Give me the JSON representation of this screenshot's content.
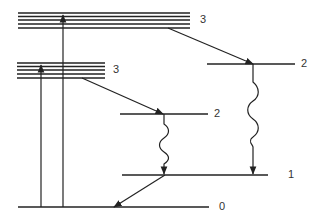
{
  "diagram": {
    "type": "energy-level-diagram",
    "colors": {
      "line": "#222222",
      "label": "#333333"
    },
    "level_labels": {
      "upper_band": "3",
      "lower_band": "3",
      "right_level_2": "2",
      "middle_level_2": "2",
      "level_1": "1",
      "level_0": "0"
    },
    "bands": [
      {
        "id": "upper_band",
        "label": "3",
        "x1": 18,
        "x2": 190,
        "ys": [
          13,
          16.5,
          20,
          24,
          28
        ],
        "label_x": 200,
        "label_y": 23
      },
      {
        "id": "lower_band",
        "label": "3",
        "x1": 17,
        "x2": 105,
        "ys": [
          63,
          66.5,
          70,
          74,
          78
        ],
        "label_x": 113,
        "label_y": 73
      }
    ],
    "levels": [
      {
        "id": "right_level_2",
        "label": "2",
        "x1": 207,
        "x2": 295,
        "y": 64,
        "label_x": 301,
        "label_y": 67
      },
      {
        "id": "middle_level_2",
        "label": "2",
        "x1": 120,
        "x2": 208,
        "y": 114,
        "label_x": 214,
        "label_y": 117
      },
      {
        "id": "level_1",
        "label": "1",
        "x1": 122,
        "x2": 268,
        "y": 175,
        "label_x": 288,
        "label_y": 178
      },
      {
        "id": "level_0",
        "label": "0",
        "x1": 18,
        "x2": 209,
        "y": 207,
        "label_x": 219,
        "label_y": 210
      }
    ],
    "transitions": [
      {
        "kind": "absorption",
        "from": "level_0",
        "to": "lower_band",
        "x": 41,
        "y1": 207,
        "y2": 66
      },
      {
        "kind": "absorption",
        "from": "level_0",
        "to": "upper_band",
        "x": 63,
        "y1": 207,
        "y2": 16
      },
      {
        "kind": "nonradiative",
        "from": "upper_band",
        "to": "right_level_2",
        "x1": 168,
        "y1": 28,
        "x2": 253,
        "y2": 64
      },
      {
        "kind": "nonradiative",
        "from": "lower_band",
        "to": "middle_level_2",
        "x1": 82,
        "y1": 78,
        "x2": 162,
        "y2": 114
      },
      {
        "kind": "emission",
        "from": "right_level_2",
        "to": "level_1",
        "x": 253,
        "y1": 64,
        "y2": 175
      },
      {
        "kind": "emission",
        "from": "middle_level_2",
        "to": "level_1",
        "x": 164,
        "y1": 114,
        "y2": 175
      },
      {
        "kind": "nonradiative",
        "from": "level_1",
        "to": "level_0",
        "x1": 165,
        "y1": 175,
        "x2": 114,
        "y2": 207
      }
    ]
  }
}
